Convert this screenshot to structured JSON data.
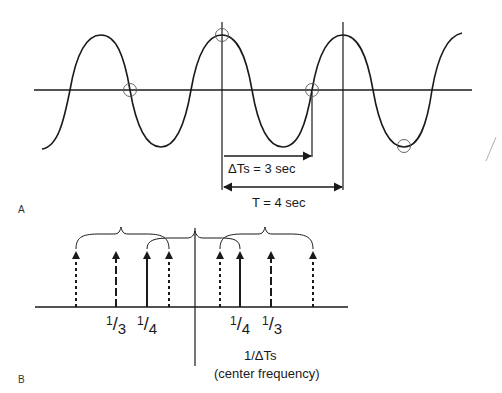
{
  "panel_a": {
    "letter": "A",
    "delta_ts_label": "ΔTs = 3 sec",
    "period_label": "T = 4 sec",
    "waveform": {
      "type": "sine",
      "period_sec": 4,
      "sample_interval_sec": 3,
      "sample_points_circled": 4
    }
  },
  "panel_b": {
    "letter": "B",
    "labels": [
      {
        "num": "1",
        "den": "3"
      },
      {
        "num": "1",
        "den": "4"
      },
      {
        "num": "1",
        "den": "4"
      },
      {
        "num": "1",
        "den": "3"
      }
    ],
    "center_label": "1/ΔTs",
    "center_sub_label": "(center frequency)",
    "spectral_lines": [
      {
        "side": "left",
        "style": "dotted"
      },
      {
        "side": "left",
        "style": "dashed",
        "label": "1/3"
      },
      {
        "side": "left",
        "style": "solid",
        "label": "1/4"
      },
      {
        "side": "left",
        "style": "dotted"
      },
      {
        "side": "right",
        "style": "dotted"
      },
      {
        "side": "right",
        "style": "solid",
        "label": "1/4"
      },
      {
        "side": "right",
        "style": "dashed",
        "label": "1/3"
      },
      {
        "side": "right",
        "style": "dotted"
      }
    ]
  },
  "colors": {
    "ink": "#1a1a1a",
    "circle": "#555555",
    "background": "#ffffff"
  }
}
